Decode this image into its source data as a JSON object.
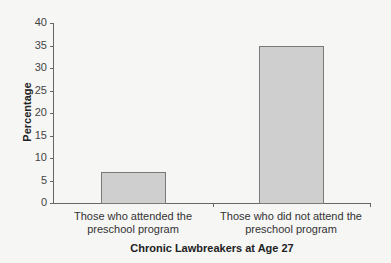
{
  "chart_data": {
    "type": "bar",
    "title": "",
    "xlabel": "Chronic Lawbreakers at Age 27",
    "ylabel": "Percentage",
    "ylim": [
      0,
      40
    ],
    "yticks": [
      0,
      5,
      10,
      15,
      20,
      25,
      30,
      35,
      40
    ],
    "grid": false,
    "legend": null,
    "categories": [
      [
        "Those who attended the",
        "preschool program"
      ],
      [
        "Those who did not attend the",
        "preschool program"
      ]
    ],
    "category_labels": [
      "Those who attended the preschool program",
      "Those who did not attend the preschool program"
    ],
    "values": [
      7,
      35
    ],
    "bar_color": "#cfcfcf",
    "bar_edge_color": "#7a7a7a"
  }
}
